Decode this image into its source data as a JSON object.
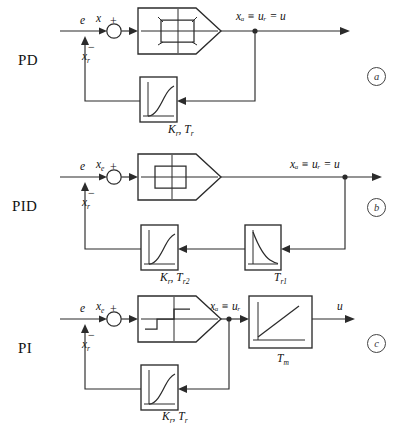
{
  "diagram": {
    "rows": [
      {
        "id": "pd",
        "label": "PD",
        "tag": "a",
        "input_signal": "e",
        "sum_plus": "+",
        "sum_minus": "−",
        "error_signal": "x",
        "error_sub": "e",
        "feedback_signal": "x",
        "feedback_sub": "r",
        "output_signal": "xₐ ≡ uᵣ = u",
        "relay": {
          "type": "hysteresis-relay",
          "labels": {
            "top_left": "−a",
            "top_right": "b",
            "bottom_left": "−b",
            "bottom_right": "a"
          }
        },
        "blocks": [
          {
            "name": "lag-block",
            "curve": "exponential-rise",
            "label": "K",
            "label_sub": "r",
            "label2": "T",
            "label2_sub": "r"
          }
        ]
      },
      {
        "id": "pid",
        "label": "PID",
        "tag": "b",
        "input_signal": "e",
        "sum_plus": "+",
        "sum_minus": "−",
        "error_signal": "x",
        "error_sub": "e",
        "feedback_signal": "x",
        "feedback_sub": "r",
        "output_signal": "xₐ ≡ uᵣ = u",
        "relay": {
          "type": "hysteresis-relay",
          "labels": {}
        },
        "blocks": [
          {
            "name": "lag-block",
            "curve": "exponential-rise",
            "label": "K",
            "label_sub": "r",
            "label2": "T",
            "label2_sub": "r2"
          },
          {
            "name": "lead-block",
            "curve": "exponential-decay",
            "label2": "T",
            "label2_sub": "r1"
          }
        ]
      },
      {
        "id": "pi",
        "label": "PI",
        "tag": "c",
        "input_signal": "e",
        "sum_plus": "+",
        "sum_minus": "−",
        "error_signal": "x",
        "error_sub": "e",
        "feedback_signal": "x",
        "feedback_sub": "r",
        "mid_signal": "xₐ ≡ uᵣ",
        "output_signal": "u",
        "relay": {
          "type": "three-position-relay",
          "labels": {}
        },
        "blocks": [
          {
            "name": "integrator-block",
            "curve": "ramp",
            "label2": "T",
            "label2_sub": "m"
          },
          {
            "name": "lag-block",
            "curve": "exponential-rise",
            "label": "K",
            "label_sub": "r",
            "label2": "T",
            "label2_sub": "r"
          }
        ]
      }
    ]
  },
  "colors": {
    "line": "#2b2b2b",
    "text": "#111111",
    "background": "#ffffff"
  }
}
